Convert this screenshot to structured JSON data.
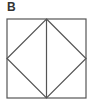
{
  "figure": {
    "label": "B",
    "stroke_color": "#555555",
    "square": {
      "x": 7,
      "y": 19,
      "width": 79,
      "height": 79
    },
    "diamond_points": [
      [
        46.5,
        19
      ],
      [
        86,
        58.5
      ],
      [
        46.5,
        98
      ],
      [
        7,
        58.5
      ]
    ],
    "vertical_line": {
      "x1": 46.5,
      "y1": 19,
      "x2": 46.5,
      "y2": 98
    }
  }
}
